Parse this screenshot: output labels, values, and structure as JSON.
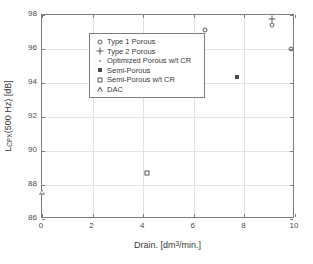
{
  "chart_data": {
    "type": "scatter",
    "title": "",
    "xlabel": "Drain. [dm3/min.]",
    "xlabel_parts": {
      "pre": "Drain. [dm",
      "sup": "3",
      "post": "/min.]"
    },
    "ylabel": "LCPX(500 Hz) [dB]",
    "ylabel_parts": {
      "pre": "L",
      "sub": "CPX",
      "post": "(500 Hz) [dB]"
    },
    "xlim": [
      0,
      10
    ],
    "ylim": [
      86,
      98
    ],
    "xticks": [
      0,
      2,
      4,
      6,
      8,
      10
    ],
    "xticklabels": [
      "0",
      "2",
      "4",
      "6",
      "8",
      "10"
    ],
    "yticks": [
      86,
      88,
      90,
      92,
      94,
      96,
      98
    ],
    "yticklabels": [
      "86",
      "88",
      "90",
      "92",
      "94",
      "96",
      "98"
    ],
    "grid": true,
    "grid_color": "#e3e3e3",
    "axis_color": "#7d7d7d",
    "background": "#ffffff",
    "legend_position": "top-left",
    "series": [
      {
        "name": "Type 1 Porous",
        "marker": "circle",
        "color": "#5a5a5a",
        "points": [
          {
            "x": 4.3,
            "y": 95.95
          },
          {
            "x": 4.52,
            "y": 95.88
          },
          {
            "x": 5.3,
            "y": 94.0
          },
          {
            "x": 5.75,
            "y": 95.2
          },
          {
            "x": 6.45,
            "y": 97.1
          },
          {
            "x": 9.1,
            "y": 97.4
          },
          {
            "x": 9.85,
            "y": 96.0
          }
        ]
      },
      {
        "name": "Type 2 Porous",
        "marker": "plus",
        "color": "#5a5a5a",
        "points": [
          {
            "x": 9.1,
            "y": 97.78
          }
        ]
      },
      {
        "name": "Optimized Porous w/t CR",
        "marker": "dot",
        "color": "#8a8a8a",
        "points": []
      },
      {
        "name": "Semi-Porous",
        "marker": "square-filled",
        "color": "#4a4a4a",
        "points": [
          {
            "x": 7.7,
            "y": 94.35
          }
        ]
      },
      {
        "name": "Semi-Porous w/t CR",
        "marker": "square-open",
        "color": "#5a5a5a",
        "points": [
          {
            "x": 4.15,
            "y": 88.7
          }
        ]
      },
      {
        "name": "DAC",
        "marker": "triangle",
        "color": "#5a5a5a",
        "points": [
          {
            "x": 0.0,
            "y": 87.6
          }
        ]
      }
    ]
  },
  "legend": {
    "entries": [
      {
        "label": "Type 1 Porous",
        "marker": "circle"
      },
      {
        "label": "Type 2 Porous",
        "marker": "plus"
      },
      {
        "label": "Optimized Porous w/t CR",
        "marker": "dot"
      },
      {
        "label": "Semi-Porous",
        "marker": "square-filled"
      },
      {
        "label": "Semi-Porous w/t CR",
        "marker": "square-open"
      },
      {
        "label": "DAC",
        "marker": "triangle"
      }
    ]
  }
}
